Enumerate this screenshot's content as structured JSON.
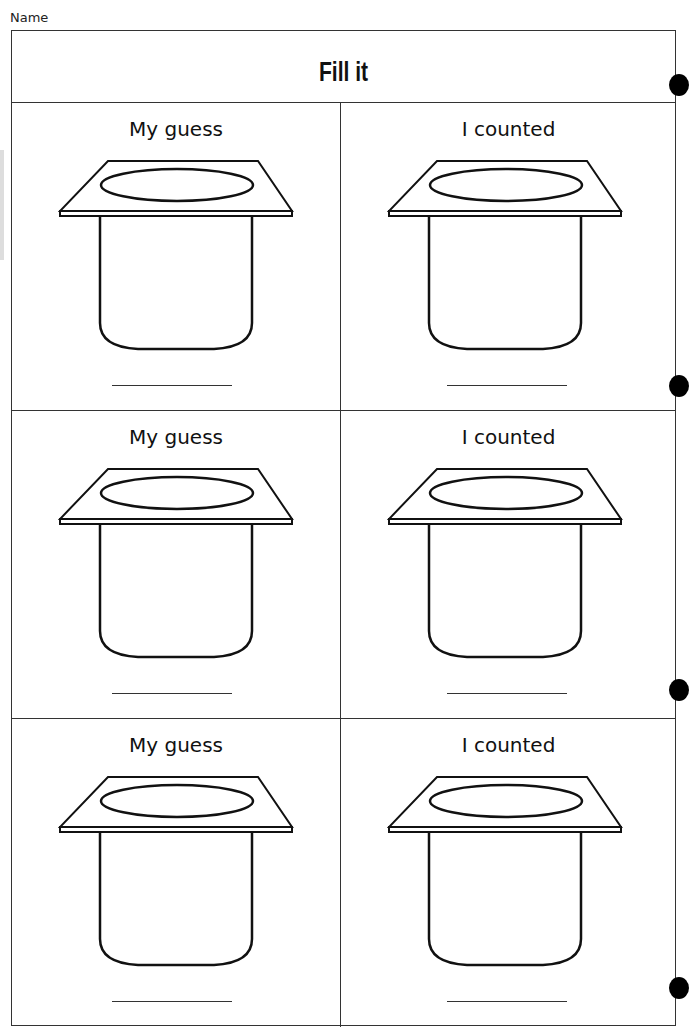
{
  "header": {
    "name_label": "Name",
    "title": "Fill it"
  },
  "rows": [
    {
      "left": {
        "label": "My guess",
        "answer": ""
      },
      "right": {
        "label": "I counted",
        "answer": ""
      }
    },
    {
      "left": {
        "label": "My guess",
        "answer": ""
      },
      "right": {
        "label": "I counted",
        "answer": ""
      }
    },
    {
      "left": {
        "label": "My guess",
        "answer": ""
      },
      "right": {
        "label": "I counted",
        "answer": ""
      }
    }
  ],
  "icons": {
    "container": "yogurt-cup-outline",
    "binder_holes": 4
  },
  "colors": {
    "line": "#333333",
    "text": "#111111",
    "hole": "#000000"
  }
}
